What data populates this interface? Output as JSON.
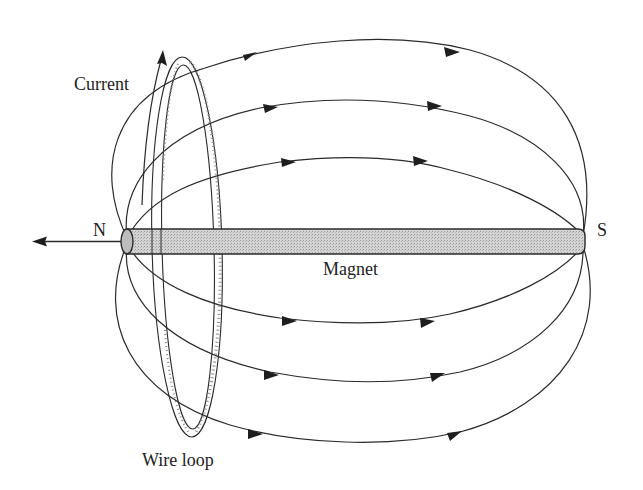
{
  "diagram": {
    "type": "physics-illustration",
    "labels": {
      "current": "Current",
      "north": "N",
      "south": "S",
      "magnet": "Magnet",
      "wire_loop": "Wire loop"
    },
    "colors": {
      "line": "#2a2a2a",
      "magnet_fill": "#c8c8c8",
      "background": "#ffffff",
      "text": "#222222"
    },
    "field_lines": {
      "count_above": 3,
      "count_below": 3,
      "direction": "N to S"
    },
    "arrows": {
      "north_direction_arrow": "pointing left from N pole",
      "current_arrow": "pointing up along the wire loop"
    }
  }
}
